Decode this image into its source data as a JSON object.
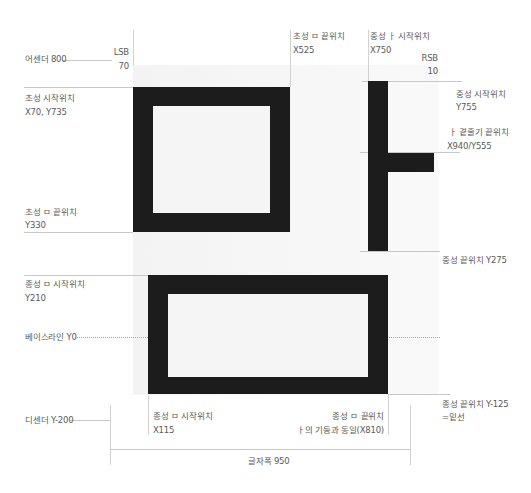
{
  "diagram": {
    "glyph": {
      "initial": "ㅁ",
      "medial": "ㅏ",
      "final": "ㅁ",
      "stroke_color": "#1c1c1c",
      "background": "#f5f5f5"
    },
    "labels": {
      "ascender": "어센더 800",
      "lsb_title": "LSB",
      "lsb_value": "70",
      "initial_end_x_title": "초성 ㅁ 끝위치",
      "initial_end_x_value": "X525",
      "medial_start_x_title": "중성 ㅏ 시작위치",
      "medial_start_x_value": "X750",
      "rsb_title": "RSB",
      "rsb_value": "10",
      "initial_start_title": "초성 시작위치",
      "initial_start_value": "X70, Y735",
      "medial_start_y_title": "중성 시작위치",
      "medial_start_y_value": "Y755",
      "medial_branch_title": "ㅏ 곁줄기 끝위치",
      "medial_branch_value": "X940/Y555",
      "initial_end_y_title": "초성 ㅁ 끝위치",
      "initial_end_y_value": "Y330",
      "medial_end": "중성 끝위치 Y275",
      "final_start_y_title": "종성 ㅁ 시작위치",
      "final_start_y_value": "Y210",
      "baseline": "베이스라인 Y0",
      "final_end_y_title": "종성 끝위치 Y-125",
      "final_end_y_value": "=밑선",
      "descender": "디센더 Y-200",
      "final_start_x_title": "종성 ㅁ 시작위치",
      "final_start_x_value": "X115",
      "final_end_x_title": "종성 ㅁ 끝위치",
      "final_end_x_value": "ㅏ의 기둥과 동일(X810)",
      "advance_width": "글자폭 950"
    }
  }
}
